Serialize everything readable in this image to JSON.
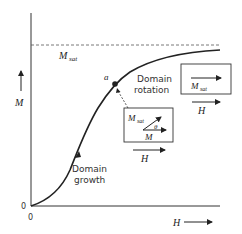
{
  "diagram": {
    "axes": {
      "y_label": "M",
      "x_label": "H",
      "y_origin_label": "0",
      "x_origin_label": "0"
    },
    "saturation": {
      "label": "M",
      "label_sub": "sat"
    },
    "point": {
      "label": "a"
    },
    "regions": {
      "growth_line1": "Domain",
      "growth_line2": "growth",
      "rotation_line1": "Domain",
      "rotation_line2": "rotation"
    },
    "right_box": {
      "vector_label": "M",
      "vector_sub": "sat",
      "field_label": "H"
    },
    "middle_box": {
      "msat_label": "M",
      "msat_sub": "sat",
      "angle_label": "θ",
      "m_label": "M",
      "field_label": "H"
    },
    "colors": {
      "ink": "#222222",
      "dash": "#555555"
    }
  }
}
